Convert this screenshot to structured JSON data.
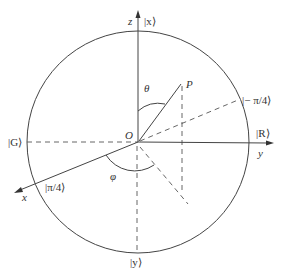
{
  "diagram": {
    "type": "sphere-coordinate-diagram",
    "axes": {
      "z": "z",
      "y": "y",
      "x": "x"
    },
    "origin_label": "O",
    "point_label": "P",
    "angles": {
      "polar": "θ",
      "azimuthal": "φ"
    },
    "states": {
      "top": "|x⟩",
      "bottom": "|y⟩",
      "left": "|G⟩",
      "right": "|R⟩",
      "upper_right": "|− π/4⟩",
      "lower_left": "|π/4⟩"
    },
    "colors": {
      "stroke": "#444444",
      "text": "#333333",
      "background": "#ffffff"
    }
  }
}
